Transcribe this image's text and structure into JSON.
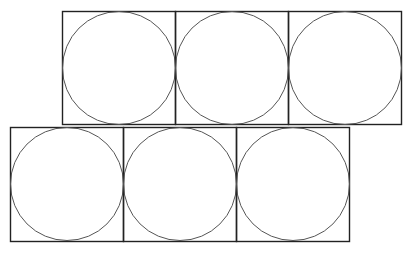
{
  "diagram": {
    "stroke_square": "#222222",
    "stroke_circle": "#555555",
    "cell": 113,
    "rows": [
      {
        "x": 62,
        "y": 11,
        "count": 3
      },
      {
        "x": 10,
        "y": 127,
        "count": 3
      }
    ]
  }
}
